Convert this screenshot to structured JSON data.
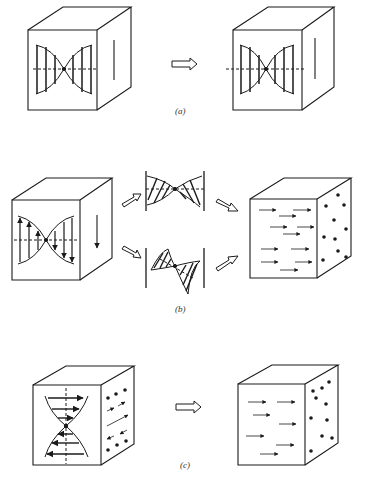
{
  "figure": {
    "panels": [
      {
        "id": "a",
        "label": "(a)",
        "description": "Cube with hourglass-shaped transverse wave profile on front face transforms into cube with shifted wave profile"
      },
      {
        "id": "b",
        "label": "(b)",
        "description": "Cube with wave profile splits into two sheared wave profiles that combine into a cube with arrow field on front and dots on side"
      },
      {
        "id": "c",
        "label": "(c)",
        "description": "Cube with horizontal hourglass wave profile and dots/arrows on side transforms into cube with arrow field and dots"
      }
    ]
  },
  "colors": {
    "line": "#1a1a1a",
    "background": "#ffffff",
    "label": "#333333"
  }
}
